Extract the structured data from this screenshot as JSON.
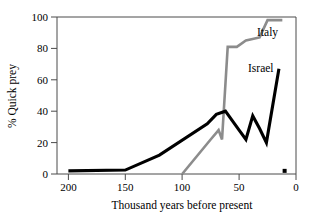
{
  "chart_data": {
    "type": "line",
    "title": "",
    "xlabel": "Thousand years before present",
    "ylabel": "% Quick prey",
    "xlim": [
      210,
      0
    ],
    "ylim": [
      0,
      100
    ],
    "x_reversed": true,
    "grid": false,
    "legend_position": "inline-right",
    "xticks": [
      200,
      150,
      100,
      50,
      0
    ],
    "xtick_labels": [
      "200",
      "150",
      "100",
      "50",
      "0"
    ],
    "yticks": [
      0,
      20,
      40,
      60,
      80,
      100
    ],
    "ytick_labels": [
      "0",
      "20",
      "40",
      "60",
      "80",
      "100"
    ],
    "series": [
      {
        "name": "Israel",
        "color": "#000000",
        "label_text": "Israel",
        "x": [
          200,
          150,
          120,
          78,
          70,
          62,
          56,
          50,
          44,
          38,
          32,
          26,
          15
        ],
        "y": [
          2,
          2.5,
          12,
          32,
          38,
          40,
          34,
          28,
          22,
          37,
          29,
          20,
          67
        ]
      },
      {
        "name": "Italy",
        "color": "#8c8c8c",
        "label_text": "Italy",
        "x": [
          100,
          75,
          68,
          65,
          60,
          52,
          44,
          32,
          25,
          12
        ],
        "y": [
          0,
          22,
          28,
          22,
          81,
          81,
          85,
          87,
          98,
          98
        ]
      }
    ],
    "point_markers": [
      {
        "x": 10,
        "y": 2,
        "color": "#000000",
        "shape": "square"
      }
    ]
  },
  "labels": {
    "italy": "Italy",
    "israel": "Israel",
    "xaxis_title": "Thousand years before present",
    "yaxis_title": "% Quick prey",
    "ytick_100": "100",
    "ytick_80": "80",
    "ytick_60": "60",
    "ytick_40": "40",
    "ytick_20": "20",
    "ytick_0": "0",
    "xtick_200": "200",
    "xtick_150": "150",
    "xtick_100": "100",
    "xtick_50": "50",
    "xtick_0": "0"
  },
  "colors": {
    "israel_line": "#000000",
    "italy_line": "#8c8c8c",
    "frame": "#4a4a4a",
    "background": "#ffffff"
  }
}
